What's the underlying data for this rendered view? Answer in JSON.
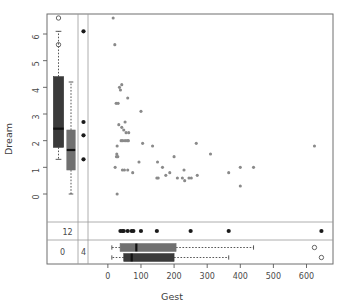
{
  "plot": {
    "type": "marginplot",
    "frame_color": "#6f6f6f",
    "point_color": "#8a8a8a",
    "dark_box_color": "#3a3a3a",
    "gray_box_color": "#707070",
    "missing_dot_color": "#1a1a1a",
    "outlier_color": "#555555"
  },
  "axes": {
    "x": {
      "label": "Gest",
      "ticks": [
        "0",
        "100",
        "200",
        "300",
        "400",
        "500",
        "600"
      ],
      "tick_values": [
        0,
        100,
        200,
        300,
        400,
        500,
        600
      ],
      "min": -60,
      "max": 680
    },
    "y": {
      "label": "Dream",
      "ticks": [
        "0",
        "1",
        "2",
        "3",
        "4",
        "5",
        "6"
      ],
      "tick_values": [
        0,
        1,
        2,
        3,
        4,
        5,
        6
      ],
      "min": -1.05,
      "max": 6.75
    }
  },
  "counts": {
    "y_missing_label": "12",
    "both_missing_label": "0",
    "x_missing_label": "4"
  },
  "chart_data": {
    "type": "scatter",
    "title": "",
    "xlabel": "Gest",
    "ylabel": "Dream",
    "xlim": [
      -60,
      680
    ],
    "ylim": [
      -1.05,
      6.75
    ],
    "grid": false,
    "legend": "none",
    "points": [
      [
        16,
        6.6
      ],
      [
        21,
        5.6
      ],
      [
        42,
        4.1
      ],
      [
        35,
        4.0
      ],
      [
        38,
        3.9
      ],
      [
        60,
        3.6
      ],
      [
        25,
        3.4
      ],
      [
        31,
        3.4
      ],
      [
        100,
        3.1
      ],
      [
        33,
        2.6
      ],
      [
        52,
        2.7
      ],
      [
        42,
        2.5
      ],
      [
        48,
        2.4
      ],
      [
        55,
        2.3
      ],
      [
        63,
        2.3
      ],
      [
        28,
        1.8
      ],
      [
        40,
        2.0
      ],
      [
        45,
        2.0
      ],
      [
        52,
        2.0
      ],
      [
        58,
        2.0
      ],
      [
        62,
        2.0
      ],
      [
        105,
        1.9
      ],
      [
        135,
        1.8
      ],
      [
        267,
        1.9
      ],
      [
        624,
        1.8
      ],
      [
        26,
        1.4
      ],
      [
        30,
        1.4
      ],
      [
        27,
        1.5
      ],
      [
        200,
        1.4
      ],
      [
        310,
        1.5
      ],
      [
        94,
        1.2
      ],
      [
        150,
        1.2
      ],
      [
        22,
        1.0
      ],
      [
        60,
        0.9
      ],
      [
        165,
        1.0
      ],
      [
        230,
        0.9
      ],
      [
        400,
        1.0
      ],
      [
        440,
        1.0
      ],
      [
        44,
        0.9
      ],
      [
        50,
        0.9
      ],
      [
        365,
        0.8
      ],
      [
        75,
        0.8
      ],
      [
        187,
        0.8
      ],
      [
        270,
        0.7
      ],
      [
        175,
        0.7
      ],
      [
        148,
        0.6
      ],
      [
        152,
        0.6
      ],
      [
        210,
        0.6
      ],
      [
        225,
        0.6
      ],
      [
        245,
        0.6
      ],
      [
        252,
        0.6
      ],
      [
        232,
        0.5
      ],
      [
        400,
        0.3
      ],
      [
        28,
        0.0
      ]
    ],
    "x_missing_rug_y": [
      [
        38,
        null
      ],
      [
        44,
        null
      ],
      [
        48,
        null
      ],
      [
        60,
        null
      ],
      [
        72,
        null
      ],
      [
        77,
        null
      ],
      [
        100,
        null
      ],
      [
        148,
        null
      ],
      [
        250,
        null
      ],
      [
        365,
        null
      ],
      [
        645,
        null
      ]
    ],
    "y_missing_rug_x": [
      [
        null,
        6.1
      ],
      [
        null,
        2.7
      ],
      [
        null,
        2.2
      ],
      [
        null,
        1.3
      ]
    ],
    "boxplot_dream_observed": {
      "orientation": "vertical",
      "fill": "#3a3a3a",
      "min": 1.3,
      "q1": 1.75,
      "median": 2.45,
      "q3": 4.4,
      "max": 6.1,
      "outliers": [
        6.6,
        5.6
      ]
    },
    "boxplot_dream_xmissing": {
      "orientation": "vertical",
      "fill": "#707070",
      "min": 0.0,
      "q1": 0.9,
      "median": 1.65,
      "q3": 2.4,
      "max": 4.2,
      "outliers": []
    },
    "boxplot_gest_ymissing": {
      "orientation": "horizontal",
      "fill": "#707070",
      "min": 12,
      "q1": 37,
      "median": 86,
      "q3": 206,
      "max": 440,
      "outliers": [
        624
      ]
    },
    "boxplot_gest_observed": {
      "orientation": "horizontal",
      "fill": "#3a3a3a",
      "min": 12,
      "q1": 48,
      "median": 72,
      "q3": 200,
      "max": 365,
      "outliers": [
        645
      ]
    }
  }
}
